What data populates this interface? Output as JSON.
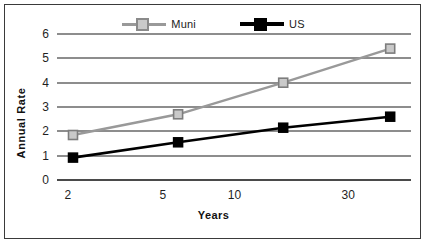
{
  "chart_data": {
    "type": "line",
    "title": "",
    "xlabel": "Years",
    "ylabel": "Annual Rate",
    "x_scale": "log",
    "x_ticks": [
      2,
      5,
      10,
      30
    ],
    "x_tick_labels": [
      "2",
      "5",
      "10",
      "30"
    ],
    "xlim": [
      1.8,
      55
    ],
    "y_ticks": [
      0,
      1,
      2,
      3,
      4,
      5,
      6
    ],
    "y_tick_labels": [
      "0",
      "1",
      "2",
      "3",
      "4",
      "5",
      "6"
    ],
    "ylim": [
      0,
      6
    ],
    "grid": true,
    "legend_position": "top-center",
    "x": [
      2.1,
      5.8,
      16,
      45
    ],
    "series": [
      {
        "name": "Muni",
        "color": "#999999",
        "marker": "square-open",
        "values": [
          1.85,
          2.7,
          4.0,
          5.4
        ]
      },
      {
        "name": "US",
        "color": "#000000",
        "marker": "square-filled",
        "values": [
          0.92,
          1.55,
          2.15,
          2.6
        ]
      }
    ]
  },
  "legend": {
    "items": [
      {
        "label": "Muni"
      },
      {
        "label": "US"
      }
    ]
  },
  "axes": {
    "y_title": "Annual Rate",
    "x_title": "Years"
  },
  "colors": {
    "muni": "#999999",
    "us": "#000000",
    "grid": "#8d8d8d",
    "axis": "#4a4a4a",
    "border": "#3a3a3a",
    "text": "#1f1f1f"
  }
}
